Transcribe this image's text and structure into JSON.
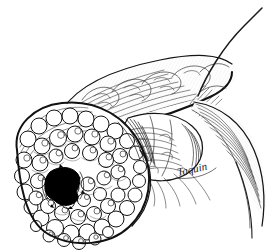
{
  "figure": {
    "domain_label": "natural-image",
    "kind": "pen-and-ink medical illustration",
    "title": "Pancreatic head tumor with necrotic cavity",
    "background_color": "#ffffff",
    "ink_color": "#1a1a1a",
    "cavity_color": "#000000",
    "width": 274,
    "height": 252
  },
  "signature": {
    "text": "Taquin",
    "x": 178,
    "y": 176
  },
  "structures": [
    {
      "id": "tumor-mass",
      "label": "Nodular tumor mass",
      "description": "Large lobulated grape-cluster mass occupying the lower left of the figure"
    },
    {
      "id": "necrotic-cavity",
      "label": "Necrotic cavity",
      "description": "Solid black irregular cavity within the tumor mass"
    },
    {
      "id": "pancreas-body",
      "label": "Pancreas body and tail",
      "description": "Elongated lobulated organ sweeping from lower left up to the upper right"
    },
    {
      "id": "duodenum",
      "label": "Duodenal loop",
      "description": "Rounded lobed segment at center right adjacent to the pancreatic head"
    },
    {
      "id": "duct",
      "label": "Duct / vessel",
      "description": "Thin curving line extending from the upper body toward the top right corner"
    },
    {
      "id": "mesentery-band",
      "label": "Mesenteric band",
      "description": "Curved tapering hatched band descending along the right side"
    }
  ]
}
